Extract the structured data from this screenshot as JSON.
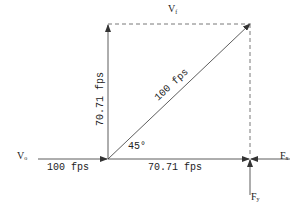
{
  "diagram": {
    "labels": {
      "v_final": "V",
      "v_final_sub": "f",
      "v_initial": "V",
      "v_initial_sub": "o",
      "f_x": "F",
      "f_x_sub": "x",
      "f_y": "F",
      "f_y_sub": "y",
      "initial_speed": "100 fps",
      "x_component": "70.71 fps",
      "y_component": "70.71 fps",
      "resultant": "100 fps",
      "angle": "45°"
    },
    "colors": {
      "line": "#333333",
      "background": "#ffffff"
    }
  }
}
